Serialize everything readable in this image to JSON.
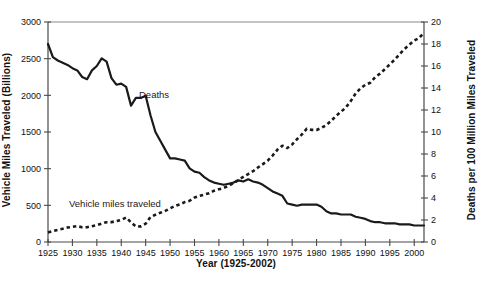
{
  "chart_data": {
    "type": "line",
    "title": "",
    "xlabel": "Year (1925-2002)",
    "ylabel": "Vehicle Miles Traveled (Billions)",
    "ylabel_right": "Deaths per 100 Million Miles Traveled",
    "xlim": [
      1925,
      2002
    ],
    "ylim": [
      0,
      3000
    ],
    "ylim_right": [
      0,
      20
    ],
    "xticks": [
      1925,
      1930,
      1935,
      1940,
      1945,
      1950,
      1955,
      1960,
      1965,
      1970,
      1975,
      1980,
      1985,
      1990,
      1995,
      2000
    ],
    "xticklabels": [
      "1925",
      "1930",
      "1935",
      "1940",
      "1945",
      "1950",
      "1955",
      "1960",
      "1965",
      "1970",
      "1975",
      "1980",
      "1985",
      "1990",
      "1995",
      "2000"
    ],
    "yticks": [
      0,
      500,
      1000,
      1500,
      2000,
      2500,
      3000
    ],
    "yticklabels": [
      "0",
      "500",
      "1000",
      "1500",
      "2000",
      "2500",
      "3000"
    ],
    "yticks_right": [
      0,
      2,
      4,
      6,
      8,
      10,
      12,
      14,
      16,
      18,
      20
    ],
    "yticklabels_right": [
      "0",
      "2",
      "4",
      "6",
      "8",
      "10",
      "12",
      "14",
      "16",
      "18",
      "20"
    ],
    "grid": false,
    "legend": "inline-annotations",
    "series": [
      {
        "name": "Deaths",
        "axis": "right",
        "style": "solid",
        "color": "#1a1a1a",
        "label_text": "Deaths",
        "x": [
          1925,
          1926,
          1927,
          1928,
          1929,
          1930,
          1931,
          1932,
          1933,
          1934,
          1935,
          1936,
          1937,
          1938,
          1939,
          1940,
          1941,
          1942,
          1943,
          1944,
          1945,
          1946,
          1947,
          1948,
          1949,
          1950,
          1951,
          1952,
          1953,
          1954,
          1955,
          1956,
          1957,
          1958,
          1959,
          1960,
          1961,
          1962,
          1963,
          1964,
          1965,
          1966,
          1967,
          1968,
          1969,
          1970,
          1971,
          1972,
          1973,
          1974,
          1975,
          1976,
          1977,
          1978,
          1979,
          1980,
          1981,
          1982,
          1983,
          1984,
          1985,
          1986,
          1987,
          1988,
          1989,
          1990,
          1991,
          1992,
          1993,
          1994,
          1995,
          1996,
          1997,
          1998,
          1999,
          2000,
          2001,
          2002
        ],
        "values": [
          18.0,
          16.8,
          16.5,
          16.3,
          16.1,
          15.8,
          15.6,
          15.0,
          14.8,
          15.6,
          16.0,
          16.7,
          16.4,
          14.9,
          14.3,
          14.4,
          14.1,
          12.4,
          13.1,
          13.1,
          13.3,
          11.5,
          10.0,
          9.2,
          8.4,
          7.6,
          7.6,
          7.5,
          7.4,
          6.7,
          6.4,
          6.3,
          5.9,
          5.6,
          5.4,
          5.3,
          5.2,
          5.3,
          5.4,
          5.6,
          5.5,
          5.7,
          5.5,
          5.4,
          5.2,
          4.9,
          4.6,
          4.4,
          4.2,
          3.5,
          3.4,
          3.3,
          3.4,
          3.4,
          3.4,
          3.4,
          3.2,
          2.8,
          2.6,
          2.6,
          2.5,
          2.5,
          2.5,
          2.3,
          2.2,
          2.1,
          1.9,
          1.8,
          1.8,
          1.7,
          1.7,
          1.7,
          1.6,
          1.6,
          1.6,
          1.5,
          1.5,
          1.5
        ]
      },
      {
        "name": "Vehicle miles traveled",
        "axis": "left",
        "style": "dashed",
        "color": "#1a1a1a",
        "label_text": "Vehicle miles traveled",
        "x": [
          1925,
          1926,
          1927,
          1928,
          1929,
          1930,
          1931,
          1932,
          1933,
          1934,
          1935,
          1936,
          1937,
          1938,
          1939,
          1940,
          1941,
          1942,
          1943,
          1944,
          1945,
          1946,
          1947,
          1948,
          1949,
          1950,
          1951,
          1952,
          1953,
          1954,
          1955,
          1956,
          1957,
          1958,
          1959,
          1960,
          1961,
          1962,
          1963,
          1964,
          1965,
          1966,
          1967,
          1968,
          1969,
          1970,
          1971,
          1972,
          1973,
          1974,
          1975,
          1976,
          1977,
          1978,
          1979,
          1980,
          1981,
          1982,
          1983,
          1984,
          1985,
          1986,
          1987,
          1988,
          1989,
          1990,
          1991,
          1992,
          1993,
          1994,
          1995,
          1996,
          1997,
          1998,
          1999,
          2000,
          2001,
          2002
        ],
        "values": [
          130,
          150,
          165,
          180,
          198,
          206,
          216,
          200,
          201,
          216,
          229,
          252,
          270,
          271,
          285,
          302,
          334,
          268,
          210,
          213,
          250,
          341,
          371,
          398,
          424,
          458,
          491,
          514,
          544,
          562,
          606,
          628,
          647,
          665,
          700,
          719,
          738,
          767,
          805,
          847,
          888,
          926,
          965,
          1016,
          1062,
          1110,
          1179,
          1260,
          1313,
          1281,
          1330,
          1402,
          1467,
          1545,
          1529,
          1527,
          1556,
          1595,
          1653,
          1720,
          1775,
          1835,
          1921,
          2026,
          2096,
          2144,
          2172,
          2247,
          2296,
          2358,
          2423,
          2486,
          2562,
          2632,
          2691,
          2747,
          2781,
          2856
        ]
      }
    ],
    "annotations": [
      {
        "text": "Deaths",
        "x": 1948,
        "y_right": 11.6
      },
      {
        "text": "Vehicle miles traveled",
        "x": 1931,
        "y_left": 530
      }
    ]
  }
}
